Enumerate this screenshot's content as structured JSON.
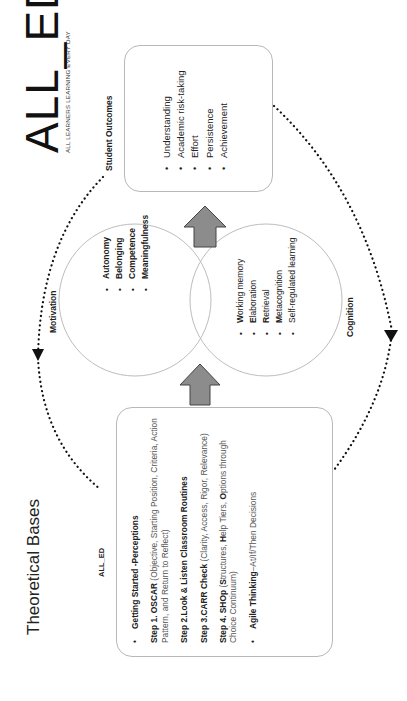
{
  "logo": {
    "main": "ALL_ED",
    "tagline": "ALL LEARNERS LEARNING EVERY DAY"
  },
  "student_outcomes": {
    "title": "Student Outcomes",
    "items": [
      "Understanding",
      "Academic risk-taking",
      "Effort",
      "Persistence",
      "Achievement"
    ]
  },
  "motivation": {
    "label": "Motivation",
    "items": [
      "Autonomy",
      "Belonging",
      "Competence",
      "Meaningfulness"
    ]
  },
  "cognition": {
    "label": "Cognition",
    "items": [
      {
        "bold": "W",
        "rest": "orking memory"
      },
      {
        "bold": "E",
        "rest": "laboration"
      },
      {
        "bold": "R",
        "rest": "etrieval"
      },
      {
        "bold": "M",
        "rest": "etacognition"
      },
      {
        "bold": "",
        "rest": "Self-regulated learning"
      }
    ]
  },
  "theoretical_bases": {
    "title": "Theoretical Bases",
    "small_logo": "ALL_ED",
    "getting_started": "Getting Started -Perceptions",
    "step1_bold": "Step 1. OSCAR",
    "step1_rest": " (Objective, Starting Position, Criteria, Action Pattern, and Return to Reflect)",
    "step2_bold": "Step 2.Look & Listen Classroom Routines",
    "step3_bold": "Step 3.CARR Check",
    "step3_rest": " (Clarity, Access, Rigor, Relevance)",
    "step4_bold": "Step 4. SHOp",
    "step4_a": " (",
    "step4_s": "S",
    "step4_b": "tructures, ",
    "step4_h": "H",
    "step4_c": "elp Tiers, ",
    "step4_o": "O",
    "step4_d": "ptions through Choice Continuum)",
    "agile_bold": "Agile Thinking",
    "agile_rest": "–At/If/Then Decisions"
  },
  "colors": {
    "arrow_fill": "#8c8c8c",
    "box_border": "#b8b8b8",
    "dotted_arc": "#111111"
  }
}
